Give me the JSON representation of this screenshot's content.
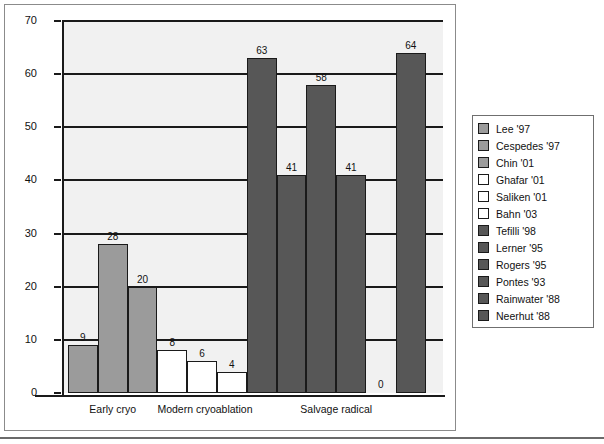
{
  "chart_data": {
    "type": "bar",
    "title": "",
    "xlabel": "",
    "ylabel": "",
    "ylim": [
      0,
      70
    ],
    "ytick_step": 10,
    "yticks": [
      "0",
      "10",
      "20",
      "30",
      "40",
      "50",
      "60",
      "70"
    ],
    "grid": true,
    "legend_position": "right-outside",
    "categories": [
      "Early cryo",
      "Modern cryoablation",
      "Salvage radical"
    ],
    "bars": [
      {
        "label": "Lee '97",
        "value": 9,
        "group": "Early cryo",
        "color": "#9b9b9b",
        "style": "gray"
      },
      {
        "label": "Cespedes '97",
        "value": 28,
        "group": "Early cryo",
        "color": "#9b9b9b",
        "style": "gray"
      },
      {
        "label": "Chin '01",
        "value": 20,
        "group": "Early cryo",
        "color": "#9b9b9b",
        "style": "gray"
      },
      {
        "label": "Ghafar '01",
        "value": 8,
        "group": "Modern cryoablation",
        "color": "#ffffff",
        "style": "white"
      },
      {
        "label": "Saliken '01",
        "value": 6,
        "group": "Modern cryoablation",
        "color": "#ffffff",
        "style": "white"
      },
      {
        "label": "Bahn '03",
        "value": 4,
        "group": "Modern cryoablation",
        "color": "#ffffff",
        "style": "white"
      },
      {
        "label": "Tefilli '98",
        "value": 63,
        "group": "Salvage radical",
        "color": "#575757",
        "style": "dark"
      },
      {
        "label": "Lerner '95",
        "value": 41,
        "group": "Salvage radical",
        "color": "#575757",
        "style": "dark"
      },
      {
        "label": "Rogers '95",
        "value": 58,
        "group": "Salvage radical",
        "color": "#575757",
        "style": "dark"
      },
      {
        "label": "Pontes '93",
        "value": 41,
        "group": "Salvage radical",
        "color": "#575757",
        "style": "dark"
      },
      {
        "label": "Rainwater '88",
        "value": 0,
        "group": "Salvage radical",
        "color": "#575757",
        "style": "dark"
      },
      {
        "label": "Neerhut '88",
        "value": 64,
        "group": "Salvage radical",
        "color": "#575757",
        "style": "dark"
      }
    ],
    "legend": [
      {
        "label": "Lee '97",
        "style": "gray"
      },
      {
        "label": "Cespedes '97",
        "style": "gray"
      },
      {
        "label": "Chin '01",
        "style": "gray"
      },
      {
        "label": "Ghafar '01",
        "style": "white"
      },
      {
        "label": "Saliken '01",
        "style": "white"
      },
      {
        "label": "Bahn '03",
        "style": "white"
      },
      {
        "label": "Tefilli '98",
        "style": "dark"
      },
      {
        "label": "Lerner '95",
        "style": "dark"
      },
      {
        "label": "Rogers '95",
        "style": "dark"
      },
      {
        "label": "Pontes '93",
        "style": "dark"
      },
      {
        "label": "Rainwater '88",
        "style": "dark"
      },
      {
        "label": "Neerhut '88",
        "style": "dark"
      }
    ]
  },
  "colors": {
    "gray_series": "#9b9b9b",
    "white_series": "#ffffff",
    "dark_series": "#575757",
    "axis": "#1a1a1a",
    "plot_background": "#f1f1f1"
  }
}
